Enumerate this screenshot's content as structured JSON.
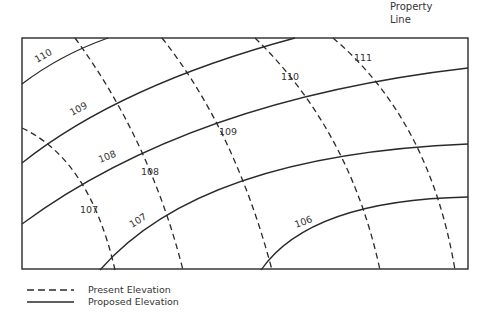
{
  "property_line_label": [
    "Property",
    "Line"
  ],
  "frame": {
    "x": 22,
    "y": 38,
    "width": 446,
    "height": 231
  },
  "proposed_contours": [
    {
      "elevation": "110",
      "path": "M22,84 Q60,55 108,38",
      "label": {
        "text": "110",
        "x": 37,
        "y": 63,
        "rotate": -30
      }
    },
    {
      "elevation": "109",
      "path": "M22,163 Q120,85 295,38",
      "label": {
        "text": "109",
        "x": 72,
        "y": 116,
        "rotate": -28
      }
    },
    {
      "elevation": "108",
      "path": "M22,224 Q190,100 468,68",
      "label": {
        "text": "108",
        "x": 100,
        "y": 163,
        "rotate": -22
      }
    },
    {
      "elevation": "107",
      "path": "M100,270 Q200,155 468,144",
      "label": {
        "text": "107",
        "x": 132,
        "y": 228,
        "rotate": -32
      }
    },
    {
      "elevation": "106",
      "path": "M261,270 Q310,200 468,197",
      "label": {
        "text": "106",
        "x": 296,
        "y": 228,
        "rotate": -20
      }
    }
  ],
  "present_contours": [
    {
      "elevation": "107",
      "path": "M22,128 Q90,160 115,270",
      "label": {
        "text": "107",
        "x": 80,
        "y": 213
      }
    },
    {
      "elevation": "108",
      "path": "M75,38 Q150,140 183,270",
      "label": {
        "text": "108",
        "x": 141,
        "y": 175
      }
    },
    {
      "elevation": "109",
      "path": "M162,38 Q235,130 272,270",
      "label": {
        "text": "109",
        "x": 219,
        "y": 135
      }
    },
    {
      "elevation": "110",
      "path": "M255,38 Q350,130 380,270",
      "label": {
        "text": "110",
        "x": 281,
        "y": 80
      }
    },
    {
      "elevation": "111",
      "path": "M333,38 Q430,120 455,270",
      "label": {
        "text": "111",
        "x": 354,
        "y": 61
      }
    }
  ],
  "legend": {
    "present": "Present Elevation",
    "proposed": "Proposed Elevation"
  }
}
